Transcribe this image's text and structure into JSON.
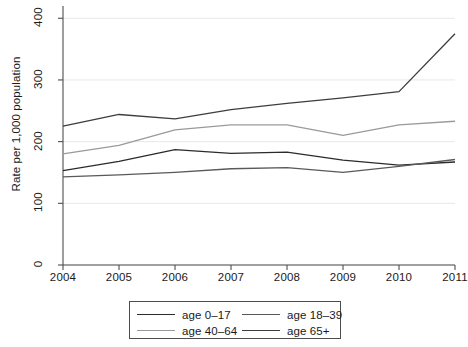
{
  "chart_data": {
    "type": "line",
    "title": "",
    "xlabel": "",
    "ylabel": "Rate per 1,000 population",
    "x": [
      2004,
      2005,
      2006,
      2007,
      2008,
      2009,
      2010,
      2011
    ],
    "xtick_labels": [
      "2004",
      "2005",
      "2006",
      "2007",
      "2008",
      "2009",
      "2010",
      "2011"
    ],
    "ytick_labels": [
      "0",
      "100",
      "200",
      "300",
      "400"
    ],
    "yticks": [
      0,
      100,
      200,
      300,
      400
    ],
    "ylim": [
      0,
      415
    ],
    "xlim": [
      2004,
      2011
    ],
    "grid": "horizontal",
    "legend_position": "bottom-center",
    "series": [
      {
        "name": "age 0-17",
        "label": "age 0–17",
        "color": "#2b2b2b",
        "values": [
          153,
          168,
          187,
          181,
          183,
          170,
          162,
          167
        ]
      },
      {
        "name": "age 18-39",
        "label": "age 18–39",
        "color": "#595959",
        "values": [
          143,
          146,
          150,
          156,
          158,
          150,
          160,
          171
        ]
      },
      {
        "name": "age 40-64",
        "label": "age 40–64",
        "color": "#9a9a9a",
        "values": [
          180,
          194,
          219,
          227,
          227,
          210,
          227,
          233
        ]
      },
      {
        "name": "age 65+",
        "label": "age 65+",
        "color": "#3d3d3d",
        "values": [
          225,
          244,
          237,
          252,
          262,
          271,
          281,
          375
        ]
      }
    ]
  },
  "legend": {
    "entries": [
      {
        "label": "age 0–17",
        "color": "#2b2b2b"
      },
      {
        "label": "age 18–39",
        "color": "#595959"
      },
      {
        "label": "age 40–64",
        "color": "#9a9a9a"
      },
      {
        "label": "age 65+",
        "color": "#3d3d3d"
      }
    ]
  }
}
